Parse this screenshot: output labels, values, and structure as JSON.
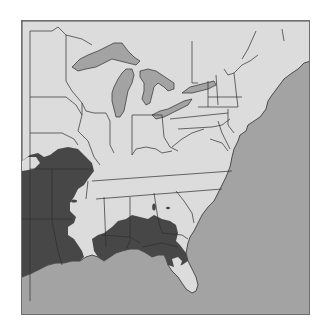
{
  "map": {
    "region": "Eastern United States",
    "colors": {
      "land": "#dcdcdc",
      "water": "#a3a3a3",
      "lakes": "#a3a3a3",
      "highlight_region": "#474747",
      "borders": "#2e2e2e",
      "frame": "#6e6e6e"
    },
    "legend": [],
    "labels": []
  }
}
